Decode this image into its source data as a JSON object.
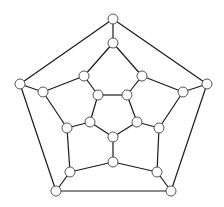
{
  "diagram": {
    "type": "graph",
    "name": "dodecahedral graph (planar embedding)",
    "node_radius": 5,
    "colors": {
      "edge": "#1a1a1a",
      "node_fill": "#ffffff",
      "node_stroke": "#555555",
      "background": "#ffffff"
    },
    "nodes": [
      {
        "id": "o0",
        "x": 113,
        "y": 19
      },
      {
        "id": "o1",
        "x": 207,
        "y": 84
      },
      {
        "id": "o2",
        "x": 171,
        "y": 191
      },
      {
        "id": "o3",
        "x": 56,
        "y": 191
      },
      {
        "id": "o4",
        "x": 20,
        "y": 84
      },
      {
        "id": "m0",
        "x": 113,
        "y": 43
      },
      {
        "id": "m1",
        "x": 142,
        "y": 76
      },
      {
        "id": "m2",
        "x": 183,
        "y": 92
      },
      {
        "id": "m3",
        "x": 159,
        "y": 128
      },
      {
        "id": "m4",
        "x": 157,
        "y": 172
      },
      {
        "id": "m5",
        "x": 113,
        "y": 162
      },
      {
        "id": "m6",
        "x": 70,
        "y": 172
      },
      {
        "id": "m7",
        "x": 67,
        "y": 128
      },
      {
        "id": "m8",
        "x": 43,
        "y": 92
      },
      {
        "id": "m9",
        "x": 84,
        "y": 76
      },
      {
        "id": "i0",
        "x": 127,
        "y": 95
      },
      {
        "id": "i1",
        "x": 137,
        "y": 122
      },
      {
        "id": "i2",
        "x": 113,
        "y": 137
      },
      {
        "id": "i3",
        "x": 90,
        "y": 122
      },
      {
        "id": "i4",
        "x": 98,
        "y": 95
      }
    ],
    "edges": [
      [
        "o0",
        "o1"
      ],
      [
        "o1",
        "o2"
      ],
      [
        "o2",
        "o3"
      ],
      [
        "o3",
        "o4"
      ],
      [
        "o4",
        "o0"
      ],
      [
        "o0",
        "m0"
      ],
      [
        "o1",
        "m2"
      ],
      [
        "o2",
        "m4"
      ],
      [
        "o3",
        "m6"
      ],
      [
        "o4",
        "m8"
      ],
      [
        "m0",
        "m1"
      ],
      [
        "m1",
        "m2"
      ],
      [
        "m2",
        "m3"
      ],
      [
        "m3",
        "m4"
      ],
      [
        "m4",
        "m5"
      ],
      [
        "m5",
        "m6"
      ],
      [
        "m6",
        "m7"
      ],
      [
        "m7",
        "m8"
      ],
      [
        "m8",
        "m9"
      ],
      [
        "m9",
        "m0"
      ],
      [
        "m1",
        "i0"
      ],
      [
        "m3",
        "i1"
      ],
      [
        "m5",
        "i2"
      ],
      [
        "m7",
        "i3"
      ],
      [
        "m9",
        "i4"
      ],
      [
        "i0",
        "i1"
      ],
      [
        "i1",
        "i2"
      ],
      [
        "i2",
        "i3"
      ],
      [
        "i3",
        "i4"
      ],
      [
        "i4",
        "i0"
      ]
    ]
  }
}
